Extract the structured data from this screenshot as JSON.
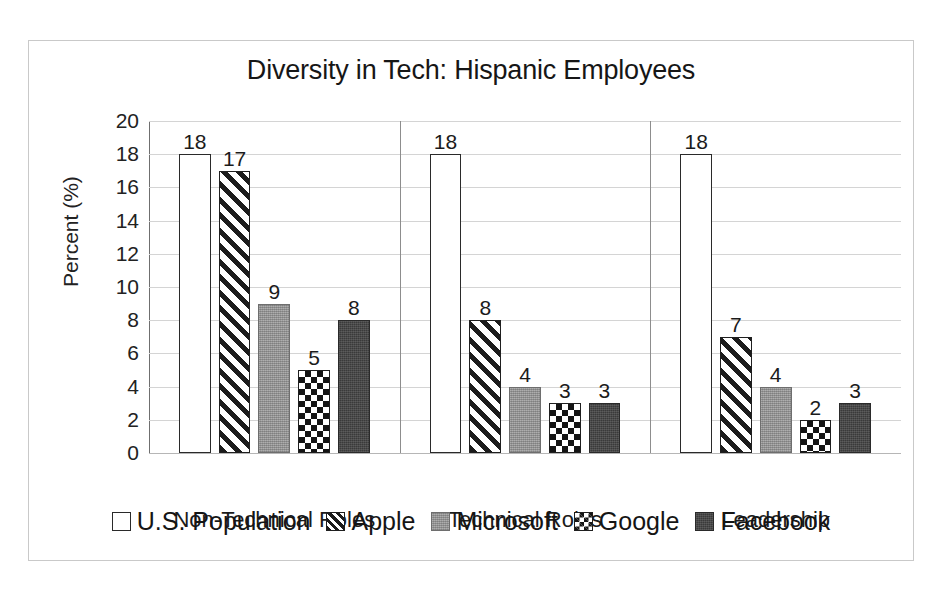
{
  "chart_data": {
    "type": "bar",
    "title": "Diversity in Tech: Hispanic Employees",
    "xlabel": "",
    "ylabel": "Percent (%)",
    "ylim": [
      0,
      20
    ],
    "ytick_step": 2,
    "yticks": [
      20,
      18,
      16,
      14,
      12,
      10,
      8,
      6,
      4,
      2,
      0
    ],
    "grid": true,
    "legend_position": "bottom",
    "categories": [
      "Non-Technical Roles",
      "Technical Roles",
      "Leadership"
    ],
    "series": [
      {
        "name": "U.S. Population",
        "fill": "none",
        "values": [
          18,
          18,
          18
        ]
      },
      {
        "name": "Apple",
        "fill": "diag",
        "values": [
          17,
          8,
          7
        ]
      },
      {
        "name": "Microsoft",
        "fill": "gray",
        "values": [
          9,
          4,
          4
        ]
      },
      {
        "name": "Google",
        "fill": "check",
        "values": [
          5,
          3,
          2
        ]
      },
      {
        "name": "Facebook",
        "fill": "dark",
        "values": [
          8,
          3,
          3
        ]
      }
    ]
  },
  "colors": {
    "us_population": "#ffffff",
    "apple": "#1c1c1c",
    "microsoft": "#9c9c9c",
    "google": "#141414",
    "facebook": "#3a3a3a",
    "gridline": "#d4d4d4",
    "axis": "#6f6f6f",
    "frame": "#c9c9c9",
    "text": "#1a1a1a"
  }
}
